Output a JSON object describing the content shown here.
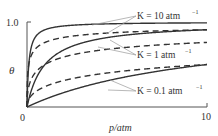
{
  "chart_data": {
    "type": "line",
    "title": "",
    "xlabel": "p/atm",
    "ylabel": "θ",
    "xlim": [
      0,
      10
    ],
    "ylim": [
      0,
      1.0
    ],
    "x_ticks": [
      "0",
      "10"
    ],
    "y_ticks": [
      "1.0"
    ],
    "grid": false,
    "legend": "inline annotations with leader lines",
    "annotations": [
      {
        "text": "K = 10 atm⁻¹",
        "targets": [
          "K=10 solid",
          "K=10 dashed"
        ]
      },
      {
        "text": "K = 1 atm⁻¹",
        "targets": [
          "K=1 solid",
          "K=1 dashed"
        ]
      },
      {
        "text": "K = 0.1 atm⁻¹",
        "targets": [
          "K=0.1 solid",
          "K=0.1 dashed"
        ]
      }
    ],
    "x": [
      0,
      0.25,
      0.5,
      1,
      2,
      3,
      4,
      5,
      6,
      7,
      8,
      9,
      10
    ],
    "series": [
      {
        "name": "K=10 solid",
        "K": 10,
        "style": "solid",
        "formula": "Kp/(1+Kp)",
        "values": [
          0,
          0.714,
          0.833,
          0.909,
          0.952,
          0.968,
          0.976,
          0.98,
          0.984,
          0.986,
          0.988,
          0.989,
          0.99
        ]
      },
      {
        "name": "K=10 dashed",
        "K": 10,
        "style": "dashed",
        "formula": "sqrt(Kp)/(1+sqrt(Kp))",
        "values": [
          0,
          0.613,
          0.691,
          0.76,
          0.817,
          0.846,
          0.863,
          0.876,
          0.886,
          0.893,
          0.899,
          0.905,
          0.909
        ]
      },
      {
        "name": "K=1 solid",
        "K": 1,
        "style": "solid",
        "formula": "Kp/(1+Kp)",
        "values": [
          0,
          0.2,
          0.333,
          0.5,
          0.667,
          0.75,
          0.8,
          0.833,
          0.857,
          0.875,
          0.889,
          0.9,
          0.909
        ]
      },
      {
        "name": "K=1 dashed",
        "K": 1,
        "style": "dashed",
        "formula": "sqrt(Kp)/(1+sqrt(Kp))",
        "values": [
          0,
          0.333,
          0.414,
          0.5,
          0.586,
          0.634,
          0.667,
          0.691,
          0.71,
          0.726,
          0.739,
          0.75,
          0.76
        ]
      },
      {
        "name": "K=0.1 solid",
        "K": 0.1,
        "style": "solid",
        "formula": "Kp/(1+Kp)",
        "values": [
          0,
          0.024,
          0.048,
          0.091,
          0.167,
          0.231,
          0.286,
          0.333,
          0.375,
          0.412,
          0.444,
          0.474,
          0.5
        ]
      },
      {
        "name": "K=0.1 dashed",
        "K": 0.1,
        "style": "dashed",
        "formula": "sqrt(Kp)/(1+sqrt(Kp))",
        "values": [
          0,
          0.137,
          0.183,
          0.24,
          0.309,
          0.354,
          0.387,
          0.414,
          0.436,
          0.456,
          0.472,
          0.487,
          0.5
        ]
      }
    ]
  },
  "labels": {
    "y_tick_top": "1.0",
    "x_tick_origin": "0",
    "x_tick_end": "10",
    "y_axis_label": "θ",
    "x_axis_label": "p/atm",
    "k10_label": "K = 10 atm",
    "k1_label": "K = 1 atm",
    "k01_label": "K = 0.1 atm",
    "exponent": "−1"
  },
  "colors": {
    "curve": "#333333",
    "axis": "#555555",
    "leader": "#999999",
    "text": "#333333"
  }
}
